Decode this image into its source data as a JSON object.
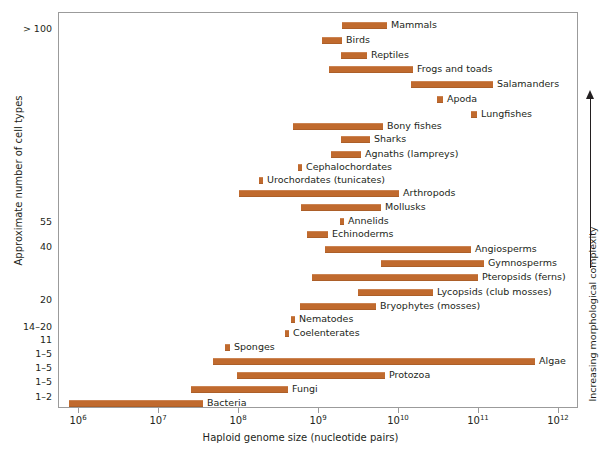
{
  "chart_data": {
    "type": "bar",
    "title": "",
    "xlabel": "Haploid genome size (nucleotide pairs)",
    "ylabel": "Approximate number of cell types",
    "right_axis_label": "Increasing morphological complexity",
    "xscale": "log",
    "xlim": [
      1000000,
      1000000000000
    ],
    "grid": false,
    "legend": "none",
    "bar_color": "#c06a2e",
    "xticks": [
      {
        "value": 1000000,
        "label": "10",
        "exp": "6"
      },
      {
        "value": 10000000,
        "label": "10",
        "exp": "7"
      },
      {
        "value": 100000000,
        "label": "10",
        "exp": "8"
      },
      {
        "value": 1000000000,
        "label": "10",
        "exp": "9"
      },
      {
        "value": 10000000000,
        "label": "10",
        "exp": "10"
      },
      {
        "value": 100000000000,
        "label": "10",
        "exp": "11"
      },
      {
        "value": 1000000000000,
        "label": "10",
        "exp": "12"
      }
    ],
    "yticks": [
      {
        "label": "> 100",
        "y": 29
      },
      {
        "label": "55",
        "y": 222
      },
      {
        "label": "40",
        "y": 247
      },
      {
        "label": "20",
        "y": 300
      },
      {
        "label": "14–20",
        "y": 327
      },
      {
        "label": "11",
        "y": 340
      },
      {
        "label": "1–5",
        "y": 354
      },
      {
        "label": "1–5",
        "y": 368
      },
      {
        "label": "1–5",
        "y": 382
      },
      {
        "label": "1–2",
        "y": 397
      }
    ],
    "bars": [
      {
        "name": "Mammals",
        "y": 21,
        "x_start": 341,
        "x_end": 386,
        "label_side": "right",
        "genome_min": 1700000000.0,
        "genome_max": 5200000000.0
      },
      {
        "name": "Birds",
        "y": 36,
        "x_start": 321,
        "x_end": 341,
        "label_side": "right",
        "genome_min": 850000000.0,
        "genome_max": 1700000000.0
      },
      {
        "name": "Reptiles",
        "y": 51,
        "x_start": 340,
        "x_end": 366,
        "label_side": "right",
        "genome_min": 1600000000.0,
        "genome_max": 4100000000.0
      },
      {
        "name": "Frogs and toads",
        "y": 65,
        "x_start": 328,
        "x_end": 412,
        "label_side": "right",
        "genome_min": 1100000000.0,
        "genome_max": 12000000000.0
      },
      {
        "name": "Salamanders",
        "y": 80,
        "x_start": 410,
        "x_end": 492,
        "label_side": "right",
        "genome_min": 11000000000.0,
        "genome_max": 120000000000.0
      },
      {
        "name": "Apoda",
        "y": 95,
        "x_start": 436,
        "x_end": 442,
        "label_side": "right",
        "genome_min": 23000000000.0,
        "genome_max": 29000000000.0
      },
      {
        "name": "Lungfishes",
        "y": 110,
        "x_start": 470,
        "x_end": 476,
        "label_side": "right",
        "genome_min": 63000000000.0,
        "genome_max": 80000000000.0
      },
      {
        "name": "Bony fishes",
        "y": 122,
        "x_start": 292,
        "x_end": 382,
        "label_side": "right",
        "genome_min": 250000000.0,
        "genome_max": 4300000000.0
      },
      {
        "name": "Sharks",
        "y": 135,
        "x_start": 340,
        "x_end": 369,
        "label_side": "right",
        "genome_min": 1600000000.0,
        "genome_max": 4700000000.0
      },
      {
        "name": "Agnaths (lampreys)",
        "y": 150,
        "x_start": 330,
        "x_end": 360,
        "label_side": "right",
        "genome_min": 1100000000.0,
        "genome_max": 3300000000.0
      },
      {
        "name": "Cephalochordates",
        "y": 163,
        "x_start": 297,
        "x_end": 301,
        "label_side": "right",
        "genome_min": 320000000.0,
        "genome_max": 400000000.0
      },
      {
        "name": "Urochordates (tunicates)",
        "y": 176,
        "x_start": 258,
        "x_end": 262,
        "label_side": "right",
        "genome_min": 140000000.0,
        "genome_max": 180000000.0
      },
      {
        "name": "Arthropods",
        "y": 189,
        "x_start": 238,
        "x_end": 398,
        "label_side": "right",
        "genome_min": 100000000.0,
        "genome_max": 7500000000.0
      },
      {
        "name": "Mollusks",
        "y": 203,
        "x_start": 300,
        "x_end": 380,
        "label_side": "right",
        "genome_min": 360000000.0,
        "genome_max": 3900000000.0
      },
      {
        "name": "Annelids",
        "y": 217,
        "x_start": 339,
        "x_end": 343,
        "label_side": "right",
        "genome_min": 1600000000.0,
        "genome_max": 1900000000.0
      },
      {
        "name": "Echinoderms",
        "y": 230,
        "x_start": 306,
        "x_end": 327,
        "label_side": "right",
        "genome_min": 470000000.0,
        "genome_max": 1000000000.0
      },
      {
        "name": "Angiosperms",
        "y": 245,
        "x_start": 324,
        "x_end": 470,
        "label_side": "right",
        "genome_min": 950000000.0,
        "genome_max": 65000000000.0
      },
      {
        "name": "Gymnosperms",
        "y": 259,
        "x_start": 380,
        "x_end": 483,
        "label_side": "right",
        "genome_min": 3900000000.0,
        "genome_max": 90000000000.0
      },
      {
        "name": "Pteropsids (ferns)",
        "y": 273,
        "x_start": 311,
        "x_end": 477,
        "label_side": "right",
        "genome_min": 600000000.0,
        "genome_max": 78000000000.0
      },
      {
        "name": "Lycopsids (club mosses)",
        "y": 288,
        "x_start": 357,
        "x_end": 432,
        "label_side": "right",
        "genome_min": 2400000000.0,
        "genome_max": 21000000000.0
      },
      {
        "name": "Bryophytes (mosses)",
        "y": 302,
        "x_start": 299,
        "x_end": 375,
        "label_side": "right",
        "genome_min": 350000000.0,
        "genome_max": 3000000000.0
      },
      {
        "name": "Nematodes",
        "y": 315,
        "x_start": 290,
        "x_end": 294,
        "label_side": "right",
        "genome_min": 260000000.0,
        "genome_max": 320000000.0
      },
      {
        "name": "Coelenterates",
        "y": 329,
        "x_start": 284,
        "x_end": 288,
        "label_side": "right",
        "genome_min": 210000000.0,
        "genome_max": 260000000.0
      },
      {
        "name": "Sponges",
        "y": 343,
        "x_start": 224,
        "x_end": 229,
        "label_side": "right",
        "genome_min": 68000000.0,
        "genome_max": 85000000.0
      },
      {
        "name": "Algae",
        "y": 357,
        "x_start": 212,
        "x_end": 534,
        "label_side": "right",
        "genome_min": 50000000.0,
        "genome_max": 600000000000.0
      },
      {
        "name": "Protozoa",
        "y": 371,
        "x_start": 236,
        "x_end": 384,
        "label_side": "right",
        "genome_min": 95000000.0,
        "genome_max": 4500000000.0
      },
      {
        "name": "Fungi",
        "y": 385,
        "x_start": 190,
        "x_end": 287,
        "label_side": "right",
        "genome_min": 27000000.0,
        "genome_max": 240000000.0
      },
      {
        "name": "Bacteria",
        "y": 399,
        "x_start": 68,
        "x_end": 202,
        "label_side": "right",
        "genome_min": 750000.0,
        "genome_max": 38000000.0
      }
    ]
  }
}
